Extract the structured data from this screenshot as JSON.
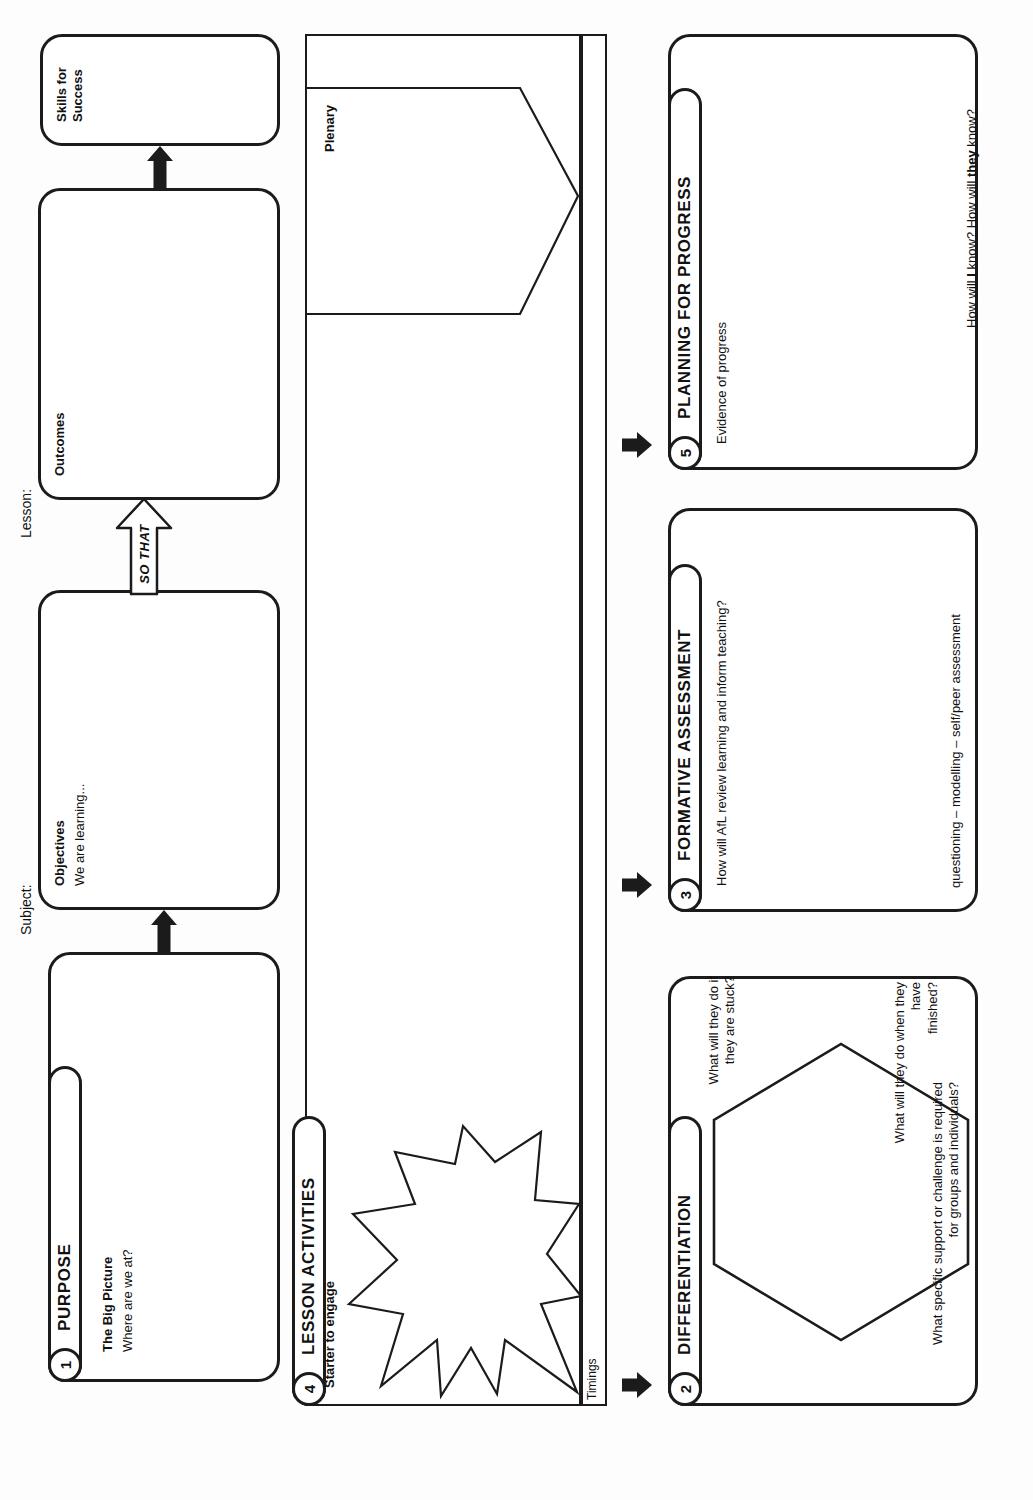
{
  "document": {
    "type": "lesson-planning-template",
    "header_fields": [
      {
        "label": "Subject:"
      },
      {
        "label": "Lesson:"
      }
    ]
  },
  "purpose": {
    "number": "1",
    "title": "PURPOSE",
    "body_heading": "The Big Picture",
    "body_sub": "Where are we at?"
  },
  "objectives": {
    "heading": "Objectives",
    "sub": "We are learning..."
  },
  "so_that": {
    "text": "SO THAT"
  },
  "outcomes": {
    "heading": "Outcomes"
  },
  "skills": {
    "heading": "Skills for Success"
  },
  "lesson_activities": {
    "number": "4",
    "title": "LESSON ACTIVITIES",
    "starter_label": "Starter to engage",
    "plenary_label": "Plenary",
    "timings_label": "Timings"
  },
  "differentiation": {
    "number": "2",
    "title": "DIFFERENTIATION",
    "q_stuck": "What will they do if they are stuck?",
    "q_finished": "What will they do when they have\nfinished?",
    "q_support": "What specific support or challenge is required\nfor groups and individuals?"
  },
  "formative_assessment": {
    "number": "3",
    "title": "FORMATIVE ASSESSMENT",
    "question": "How will AfL review learning and inform teaching?",
    "footnote": "questioning – modelling – self/peer assessment"
  },
  "planning_for_progress": {
    "number": "5",
    "title": "PLANNING FOR PROGRESS",
    "evidence_label": "Evidence of progress",
    "footnote_pre": "How will ",
    "footnote_b1": "I",
    "footnote_mid": " know? How will ",
    "footnote_b2": "they",
    "footnote_post": " know?"
  },
  "colors": {
    "ink": "#1b1b1b",
    "paper": "#ffffff"
  }
}
